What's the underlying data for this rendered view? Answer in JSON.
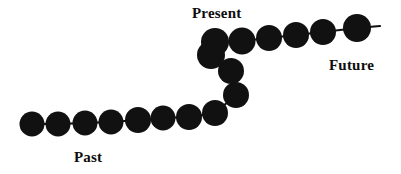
{
  "figure": {
    "type": "diagram",
    "title_visible": false,
    "background_color": "#ffffff",
    "bead_color": "#111111",
    "link_color": "#111111",
    "width": 401,
    "height": 174,
    "description_visible": false
  },
  "labels": {
    "past": "Past",
    "present": "Present",
    "future": "Future"
  },
  "chain": {
    "bead_radius": 12.5,
    "segments": [
      {
        "name": "past-segment",
        "beads": [
          {
            "cx": 32,
            "cy": 124
          },
          {
            "cx": 58,
            "cy": 124
          },
          {
            "cx": 85,
            "cy": 123
          },
          {
            "cx": 111,
            "cy": 122
          },
          {
            "cx": 138,
            "cy": 120
          },
          {
            "cx": 163,
            "cy": 118
          },
          {
            "cx": 189,
            "cy": 117
          }
        ]
      },
      {
        "name": "present-segment",
        "beads": [
          {
            "cx": 215,
            "cy": 113
          },
          {
            "cx": 236,
            "cy": 95
          },
          {
            "cx": 231,
            "cy": 71
          },
          {
            "cx": 211,
            "cy": 55
          },
          {
            "cx": 215,
            "cy": 42
          }
        ]
      },
      {
        "name": "future-segment",
        "beads": [
          {
            "cx": 242,
            "cy": 41
          },
          {
            "cx": 269,
            "cy": 38
          },
          {
            "cx": 296,
            "cy": 35
          },
          {
            "cx": 323,
            "cy": 32
          },
          {
            "cx": 357,
            "cy": 28
          }
        ]
      }
    ],
    "tail": {
      "x1": 369,
      "y1": 27,
      "x2": 380,
      "y2": 26
    }
  }
}
